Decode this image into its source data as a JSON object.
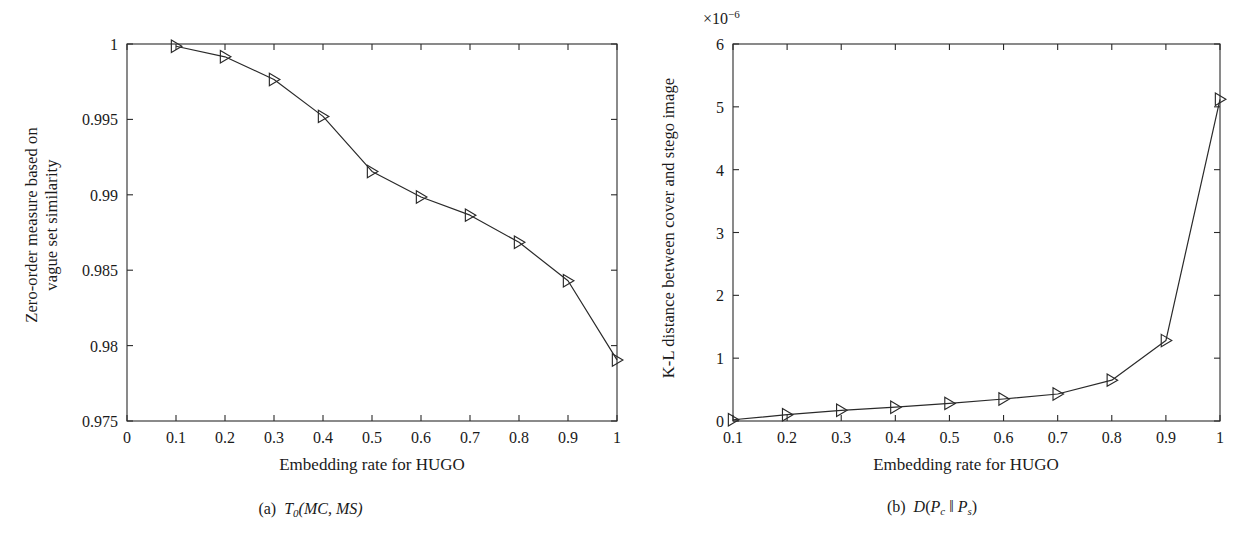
{
  "figure": {
    "panels": [
      {
        "id": "panel-a",
        "caption_prefix": "(a)",
        "caption_symbol": "T",
        "caption_sub": "0",
        "caption_args": "(MC, MS)",
        "xlabel": "Embedding rate for HUGO",
        "ylabel_line1": "Zero-order measure based on",
        "ylabel_line2": "vague set similarity",
        "exponent": "",
        "xticks": [
          "0",
          "0.1",
          "0.2",
          "0.3",
          "0.4",
          "0.5",
          "0.6",
          "0.7",
          "0.8",
          "0.9",
          "1"
        ],
        "yticks": [
          "0.975",
          "0.98",
          "0.985",
          "0.99",
          "0.995",
          "1"
        ]
      },
      {
        "id": "panel-b",
        "caption_prefix": "(b)",
        "caption_symbol": "D",
        "caption_sub": "",
        "caption_args": "(P_c ‖ P_s)",
        "xlabel": "Embedding rate for HUGO",
        "ylabel_line1": "K-L distance between cover and stego image",
        "ylabel_line2": "",
        "exponent": "×10",
        "exponent_sup": "−6",
        "xticks": [
          "0.1",
          "0.2",
          "0.3",
          "0.4",
          "0.5",
          "0.6",
          "0.7",
          "0.8",
          "0.9",
          "1"
        ],
        "yticks": [
          "0",
          "1",
          "2",
          "3",
          "4",
          "5",
          "6"
        ]
      }
    ],
    "line_color": "#2a2a2a",
    "marker": "right-triangle"
  },
  "chart_data": [
    {
      "type": "line",
      "title": "(a) T0(MC, MS)",
      "xlabel": "Embedding rate for HUGO",
      "ylabel": "Zero-order measure based on vague set similarity",
      "xlim": [
        0,
        1
      ],
      "ylim": [
        0.975,
        1
      ],
      "xticks": [
        0,
        0.1,
        0.2,
        0.3,
        0.4,
        0.5,
        0.6,
        0.7,
        0.8,
        0.9,
        1
      ],
      "yticks": [
        0.975,
        0.98,
        0.985,
        0.99,
        0.995,
        1
      ],
      "grid": false,
      "legend": "none",
      "marker": "right-triangle",
      "x": [
        0.1,
        0.2,
        0.3,
        0.4,
        0.5,
        0.6,
        0.7,
        0.8,
        0.9,
        1.0
      ],
      "values": [
        0.99985,
        0.99915,
        0.99765,
        0.9952,
        0.99155,
        0.98985,
        0.98865,
        0.98685,
        0.9843,
        0.97905
      ]
    },
    {
      "type": "line",
      "title": "(b) D(Pc || Ps)",
      "xlabel": "Embedding rate for HUGO",
      "ylabel": "K-L distance between cover and stego image",
      "y_exponent": "×10⁻⁶",
      "xlim": [
        0.1,
        1
      ],
      "ylim": [
        0,
        6
      ],
      "xticks": [
        0.1,
        0.2,
        0.3,
        0.4,
        0.5,
        0.6,
        0.7,
        0.8,
        0.9,
        1
      ],
      "yticks": [
        0,
        1,
        2,
        3,
        4,
        5,
        6
      ],
      "grid": false,
      "legend": "none",
      "marker": "right-triangle",
      "x": [
        0.1,
        0.2,
        0.3,
        0.4,
        0.5,
        0.6,
        0.7,
        0.8,
        0.9,
        1.0
      ],
      "values": [
        0.02,
        0.1,
        0.17,
        0.22,
        0.28,
        0.35,
        0.43,
        0.65,
        1.28,
        5.12
      ]
    }
  ]
}
